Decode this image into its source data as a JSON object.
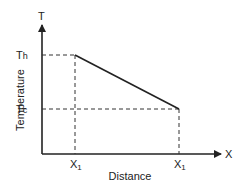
{
  "diagram": {
    "type": "temperature-distance graph",
    "axes": {
      "y_symbol": "T",
      "x_symbol": "X",
      "y_label": "Temperature",
      "x_label": "Distance"
    },
    "ticks": {
      "y_high": {
        "main": "T",
        "sub": "h"
      },
      "y_low": {
        "main": "T",
        "sub": "c"
      },
      "x_left": {
        "main": "X",
        "sub": "1"
      },
      "x_right": {
        "main": "X",
        "sub": "1"
      }
    },
    "line": {
      "description": "Linear decrease from Th at left X1 to Tc at right X1",
      "color": "#222222"
    }
  }
}
